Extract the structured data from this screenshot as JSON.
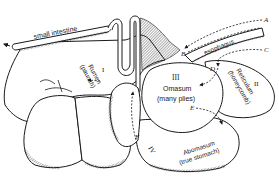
{
  "diagram": {
    "colors": {
      "line": "#1a1a1a",
      "fill": "#ffffff",
      "shade": "#555555"
    },
    "organs": {
      "small_intestine": {
        "label": "small intestine"
      },
      "esophagus": {
        "label": "esophagus"
      },
      "rumen": {
        "numeral": "I",
        "name": "Rumen",
        "common": "(paunch)"
      },
      "reticulum": {
        "numeral": "II",
        "name": "Reticulum",
        "common": "(honeycomb)"
      },
      "omasum": {
        "numeral": "III",
        "name": "Omasum",
        "common": "(many plies)"
      },
      "abomasum": {
        "numeral": "IV",
        "name": "Abomasum",
        "common": "(true stomach)"
      }
    },
    "path_points": {
      "A": "A",
      "B": "B",
      "C": "C",
      "D": "D",
      "E": "E",
      "F": "F"
    }
  }
}
